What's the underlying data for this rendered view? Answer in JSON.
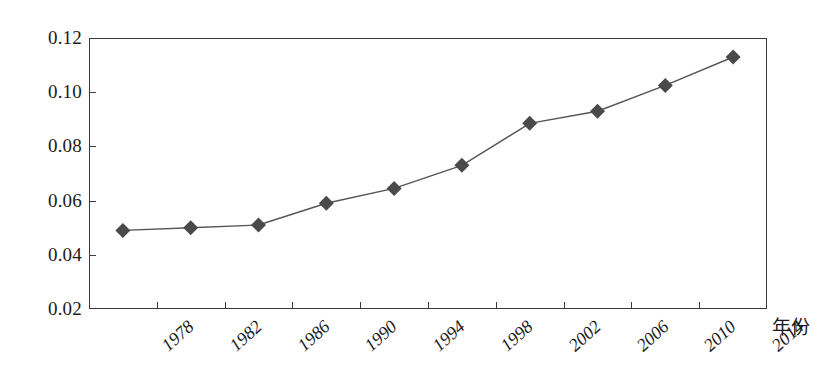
{
  "chart_data": {
    "type": "line",
    "title": "",
    "subtitle": "",
    "xlabel": "年份",
    "ylabel": "",
    "categories": [
      "1978",
      "1982",
      "1986",
      "1990",
      "1994",
      "1998",
      "2002",
      "2006",
      "2010",
      "2014"
    ],
    "series": [
      {
        "name": "",
        "values": [
          0.049,
          0.05,
          0.051,
          0.059,
          0.0645,
          0.073,
          0.0885,
          0.093,
          0.1025,
          0.113
        ]
      }
    ],
    "ylim": [
      0.02,
      0.12
    ],
    "ytick_labels": [
      "0.12",
      "0.10",
      "0.08",
      "0.06",
      "0.04",
      "0.02"
    ],
    "ytick_values": [
      0.12,
      0.1,
      0.08,
      0.06,
      0.04,
      0.02
    ],
    "grid": false,
    "legend": "none",
    "marker": "diamond",
    "marker_color": "#4a4a4a",
    "line_color": "#555555",
    "axis_color": "#3a3a3a",
    "background_color": "#ffffff"
  }
}
